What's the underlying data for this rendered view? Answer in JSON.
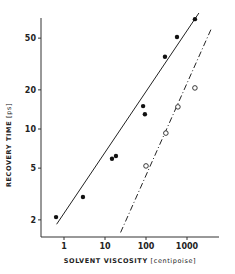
{
  "chart_data": {
    "type": "scatter",
    "title": "",
    "xlabel": "SOLVENT VISCOSITY",
    "xlabel_unit": "[centipoise]",
    "ylabel": "RECOVERY TIME",
    "ylabel_unit": "[ps]",
    "xscale": "log",
    "yscale": "log",
    "xlim": [
      0.35,
      5000
    ],
    "ylim": [
      1.45,
      80
    ],
    "x_ticks": [
      1,
      10,
      100,
      1000
    ],
    "x_tick_labels": [
      "1",
      "10",
      "100",
      "1000"
    ],
    "y_ticks": [
      2,
      5,
      10,
      20,
      50
    ],
    "y_tick_labels": [
      "2",
      "5",
      "10",
      "20",
      "50"
    ],
    "grid": false,
    "legend": null,
    "series": [
      {
        "name": "filled circles",
        "marker": "filled-circle",
        "x": [
          0.64,
          2.9,
          14.8,
          18.5,
          85,
          94,
          290,
          570,
          1560
        ],
        "y": [
          2.1,
          3.0,
          5.9,
          6.2,
          15.0,
          13.0,
          36,
          51,
          70
        ]
      },
      {
        "name": "open circles",
        "marker": "open-circle",
        "x": [
          100,
          305,
          600,
          1560
        ],
        "y": [
          5.2,
          9.3,
          14.8,
          20.7
        ]
      }
    ],
    "fit_lines": [
      {
        "name": "solid fit (filled circles)",
        "style": "solid",
        "x": [
          0.66,
          1950
        ],
        "y": [
          1.85,
          78
        ]
      },
      {
        "name": "dash-dot fit (open circles)",
        "style": "dash-dot",
        "x": [
          24,
          4000
        ],
        "y": [
          1.6,
          60
        ]
      }
    ]
  }
}
